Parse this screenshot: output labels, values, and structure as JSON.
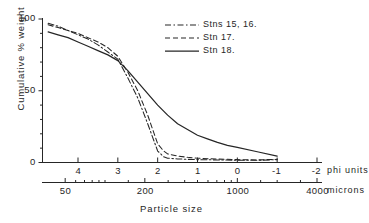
{
  "chart_data": {
    "type": "line",
    "title": "",
    "xlabel": "Particle size",
    "ylabel": "Cumulative % weight",
    "x_axis_primary_name": "phi units",
    "x_axis_secondary_name": "microns",
    "xlim_phi": [
      4.9,
      -2.4
    ],
    "ylim": [
      0,
      100
    ],
    "grid": false,
    "legend_position": "top-right",
    "phi_ticks": [
      4,
      3,
      2,
      1,
      0,
      -1,
      -2
    ],
    "phi_tick_labels": [
      "4",
      "3",
      "2",
      "1",
      "0",
      "-1",
      "-2"
    ],
    "micron_ticks": [
      50,
      200,
      1000,
      4000
    ],
    "micron_tick_labels": [
      "50",
      "200",
      "1000",
      "4000"
    ],
    "y_ticks": [
      0,
      50,
      100
    ],
    "y_tick_labels": [
      "0",
      "50",
      "100"
    ],
    "y_minor_tick_step": 10,
    "series": [
      {
        "name": "Stns 15, 16.",
        "style": "dash-dot",
        "x": [
          4.75,
          4.5,
          4.25,
          4.0,
          3.75,
          3.5,
          3.25,
          3.0,
          2.75,
          2.5,
          2.25,
          2.0,
          1.85,
          1.75,
          1.5,
          1.25,
          1.0,
          0.5,
          0.0,
          -0.5,
          -1.0
        ],
        "values": [
          97,
          95,
          92,
          89,
          86,
          82,
          77,
          72,
          59,
          45,
          27,
          8,
          4,
          3,
          2.5,
          2.2,
          2.0,
          1.8,
          1.6,
          1.5,
          2.0
        ]
      },
      {
        "name": "Stn 17.",
        "style": "dashed",
        "x": [
          4.75,
          4.5,
          4.25,
          4.0,
          3.75,
          3.5,
          3.25,
          3.0,
          2.75,
          2.5,
          2.25,
          2.0,
          1.85,
          1.75,
          1.5,
          1.25,
          1.0,
          0.5,
          0.0,
          -0.5,
          -1.0
        ],
        "values": [
          96,
          94,
          92,
          90,
          87,
          84,
          80,
          74,
          63,
          50,
          33,
          13,
          8,
          6,
          4.5,
          3.6,
          3.0,
          2.4,
          2.0,
          1.8,
          2.2
        ]
      },
      {
        "name": "Stn 18.",
        "style": "solid",
        "x": [
          4.75,
          4.5,
          4.25,
          4.0,
          3.75,
          3.5,
          3.25,
          3.0,
          2.75,
          2.5,
          2.25,
          2.0,
          1.75,
          1.5,
          1.25,
          1.0,
          0.75,
          0.5,
          0.25,
          0.0,
          -0.5,
          -1.0
        ],
        "values": [
          91,
          89,
          87,
          84,
          81,
          78,
          75,
          71,
          64,
          56,
          48,
          40,
          33,
          27,
          23,
          19,
          16.5,
          14,
          12,
          10.5,
          7.5,
          4.5
        ]
      }
    ]
  },
  "legend": {
    "entries": [
      {
        "label": "Stns 15, 16.",
        "style": "dash-dot"
      },
      {
        "label": "Stn 17.",
        "style": "dashed"
      },
      {
        "label": "Stn 18.",
        "style": "solid"
      }
    ]
  },
  "axes": {
    "y_title": "Cumulative % weight",
    "x_title": "Particle size",
    "phi_units_label": "phi units",
    "microns_label": "microns"
  }
}
